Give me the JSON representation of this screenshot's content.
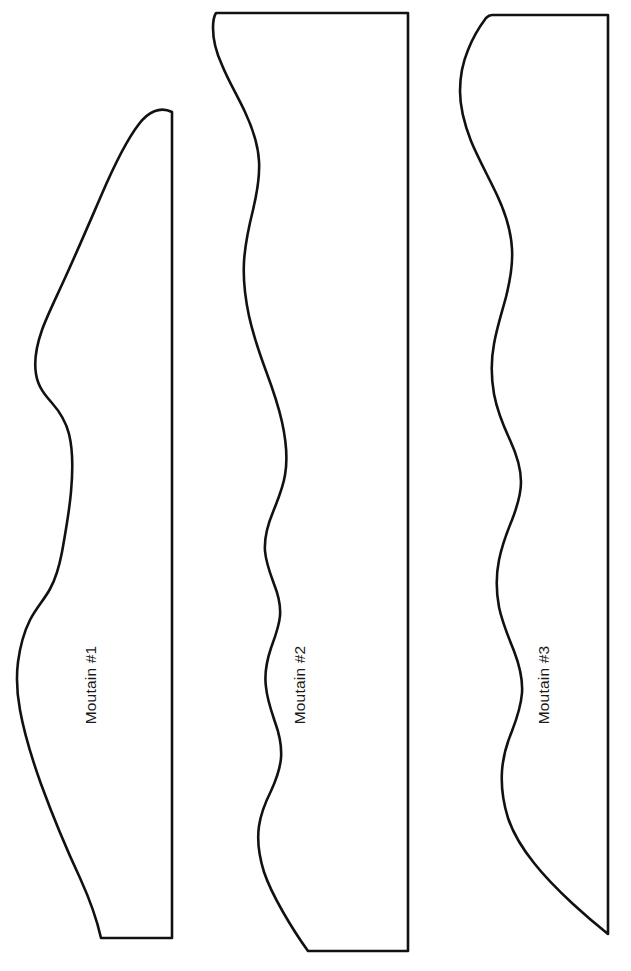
{
  "page": {
    "background_color": "#ffffff",
    "line_color": "#111111",
    "text_color": "#1a1a1a",
    "width": 631,
    "height": 971,
    "orientation": "portrait",
    "label_rotation_degrees": -90
  },
  "shapes": [
    {
      "id": "mountain-1",
      "label": "Moutain #1",
      "label_x": 96,
      "label_y": 685,
      "outline_path": "M 172 112 C 160 106 148 112 139 124 C 125 142 113 168 101 196 C 88 226 76 254 65 278 C 55 300 47 316 42 330 C 36 347 34 362 36 374 C 38 387 45 395 52 403 C 60 412 66 422 69 434 C 73 450 73 470 71 492 C 69 514 65 535 62 552 C 59 568 55 580 50 589 C 44 600 36 608 30 620 C 24 632 20 647 18 662 C 16 678 17 694 20 710 C 24 732 31 756 41 784 C 52 814 66 848 80 878 C 90 900 97 920 101 938 L 172 938 Z",
      "has_flat_top": false,
      "has_flat_bottom": true
    },
    {
      "id": "mountain-2",
      "label": "Moutain #2",
      "label_x": 305,
      "label_y": 685,
      "outline_path": "M 252 13 L 408 13 L 408 951 L 308 951 C 300 940 291 926 283 912 C 275 898 268 884 264 872 C 259 856 257 840 259 826 C 261 812 266 801 271 791 C 276 780 280 770 281 758 C 282 745 279 733 275 722 C 271 710 267 699 266 687 C 264 673 267 660 271 648 C 275 637 279 627 280 616 C 281 604 278 594 274 584 C 270 573 266 563 265 551 C 264 537 268 524 273 512 C 278 499 283 488 285 475 C 288 458 286 440 282 422 C 278 404 272 387 266 371 C 259 352 253 334 249 316 C 245 297 243 279 244 262 C 245 243 249 226 253 210 C 257 193 260 177 259 161 C 258 143 252 127 245 112 C 237 95 228 80 222 65 C 216 52 213 39 213 28 C 213 21 214 16 216 13 Z",
      "has_flat_top": true,
      "has_flat_bottom": true
    },
    {
      "id": "mountain-3",
      "label": "Moutain #3",
      "label_x": 549,
      "label_y": 685,
      "outline_path": "M 492 15 L 608 15 L 608 934 C 598 926 586 916 573 904 C 559 891 545 877 534 863 C 522 848 513 833 508 818 C 503 802 501 786 502 771 C 503 756 507 743 512 731 C 517 718 521 706 522 693 C 523 678 519 664 514 651 C 508 636 502 622 499 607 C 496 591 496 575 499 560 C 502 545 507 532 512 520 C 517 507 521 495 521 482 C 521 467 516 453 510 440 C 503 425 497 410 494 394 C 491 377 491 360 494 344 C 497 327 502 312 506 297 C 510 281 513 265 512 249 C 511 230 505 212 497 195 C 488 176 478 158 471 141 C 464 123 460 106 460 91 C 460 76 463 62 468 50 C 473 37 480 26 486 18 C 488 16 490 15 492 15 Z",
      "has_flat_top": true,
      "has_flat_bottom": false
    }
  ]
}
